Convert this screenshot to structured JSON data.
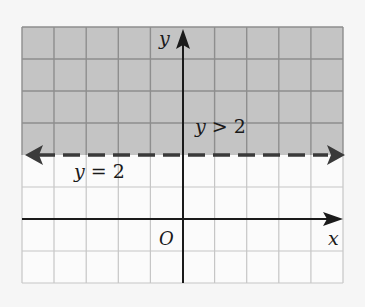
{
  "diagram": {
    "grid": {
      "columns": 10,
      "rows": 8,
      "left": 22,
      "top": 27,
      "cell": 32.1
    },
    "colors": {
      "shade": "#c4c4c4",
      "grid_line": "#9a9a9a",
      "grid_line_light": "#c8c8c8",
      "axis": "#1a1a1a",
      "boundary": "#3a3a3a",
      "background": "#f6f6f6"
    },
    "axes": {
      "x_label": "x",
      "y_label": "y",
      "origin_label": "O"
    },
    "boundary": {
      "equation": "y = 2",
      "style": "dashed"
    },
    "region": {
      "inequality": "y > 2",
      "shaded": "above"
    }
  }
}
